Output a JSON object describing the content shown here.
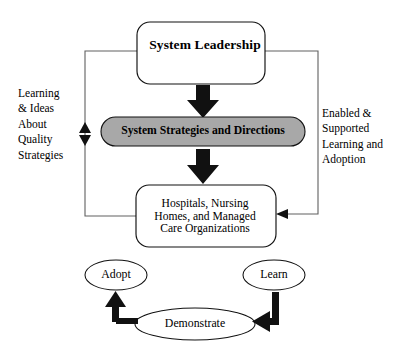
{
  "diagram": {
    "colors": {
      "stroke": "#000000",
      "strategies_fill": "#a8a8a8",
      "box_fill": "#ffffff",
      "connector": "#555555",
      "arrow_fill": "#000000"
    },
    "nodes": {
      "leadership": {
        "label": "System Leadership",
        "shape": "rounded-rect",
        "fill": "#ffffff"
      },
      "strategies": {
        "label": "System Strategies and Directions",
        "shape": "pill",
        "fill": "#a8a8a8"
      },
      "providers": {
        "label": "Hospitals, Nursing\nHomes, and Managed\nCare Organizations",
        "shape": "rounded-rect",
        "fill": "#ffffff"
      },
      "adopt": {
        "label": "Adopt",
        "shape": "ellipse",
        "fill": "#ffffff"
      },
      "learn": {
        "label": "Learn",
        "shape": "ellipse",
        "fill": "#ffffff"
      },
      "demonstrate": {
        "label": "Demonstrate",
        "shape": "ellipse",
        "fill": "#ffffff"
      }
    },
    "captions": {
      "left": "Learning\n& Ideas\nAbout\nQuality\nStrategies",
      "right": "Enabled &\nSupported\nLearning and\nAdoption"
    },
    "connectors": [
      {
        "name": "leadership-to-strategies",
        "kind": "block-arrow",
        "direction": "down"
      },
      {
        "name": "strategies-to-providers",
        "kind": "block-arrow",
        "direction": "down"
      },
      {
        "name": "left-feedback-loop",
        "kind": "line",
        "marker": "double-arrowhead-vertical"
      },
      {
        "name": "right-feedback-loop",
        "kind": "line",
        "marker": "arrowhead-left"
      },
      {
        "name": "demonstrate-to-adopt",
        "kind": "elbow-arrow",
        "direction": "up"
      },
      {
        "name": "learn-to-demonstrate",
        "kind": "elbow-arrow",
        "direction": "left"
      }
    ]
  }
}
